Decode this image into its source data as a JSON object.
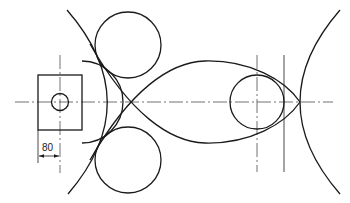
{
  "drawing": {
    "title": "Tangent arc construction drawing",
    "dimensions": [
      {
        "label": "80",
        "type": "linear-horizontal"
      }
    ],
    "elements": [
      "rectangle-block",
      "small-hole-circle",
      "top-circle",
      "bottom-circle",
      "right-small-circle",
      "left-large-arc",
      "right-large-arc",
      "left-lens-arc",
      "upper-connecting-arc",
      "lower-connecting-arc",
      "horizontal-centerline",
      "vertical-centerline-left",
      "vertical-centerline-right",
      "vertical-reference-line-right"
    ],
    "line_color": "#1a1a1a",
    "background": "#ffffff"
  }
}
